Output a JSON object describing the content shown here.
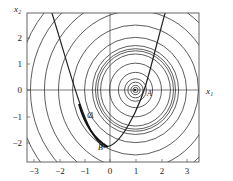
{
  "chart_data": {
    "type": "contour",
    "title": "",
    "xlabel": "x1",
    "ylabel": "x2",
    "xlim": [
      -3.25,
      3.5
    ],
    "ylim": [
      -2.75,
      2.9
    ],
    "x_ticks": [
      -3,
      -2,
      -1,
      0,
      1,
      2,
      3
    ],
    "y_ticks": [
      2,
      1,
      0,
      -1,
      -2
    ],
    "contour_center": [
      1,
      0
    ],
    "contour_shape": "concentric circles",
    "contour_radii": [
      0.1,
      0.18,
      0.3,
      0.43,
      0.67,
      1.02,
      1.37,
      1.49,
      1.57,
      1.69,
      2.0,
      2.47,
      3.02,
      3.57,
      4.12,
      4.63,
      5.18,
      5.73
    ],
    "constraint_curve": {
      "type": "parabola",
      "points": [
        [
          -2.3,
          2.9
        ],
        [
          -1.05,
          0
        ],
        [
          -0.1,
          -2.13
        ],
        [
          1.35,
          0
        ],
        [
          2.15,
          2.9
        ]
      ]
    },
    "points": [
      {
        "label": "A",
        "x": 1.0,
        "y": 0.0
      },
      {
        "label": "B",
        "x": -0.33,
        "y": -2.1
      },
      {
        "label": "C",
        "x": -0.8,
        "y": -1.0
      }
    ]
  },
  "labels": {
    "xlabel": "x₁",
    "ylabel": "x₂",
    "x_ticks": [
      "−3",
      "−2",
      "−1",
      "0",
      "1",
      "2",
      "3"
    ],
    "y_ticks": [
      "2",
      "1",
      "0",
      "−1",
      "−2"
    ],
    "point_a": "A",
    "point_b": "B",
    "point_c": "C"
  },
  "colors": {
    "line": "#333333",
    "frame": "#555555",
    "background": "#ffffff"
  }
}
